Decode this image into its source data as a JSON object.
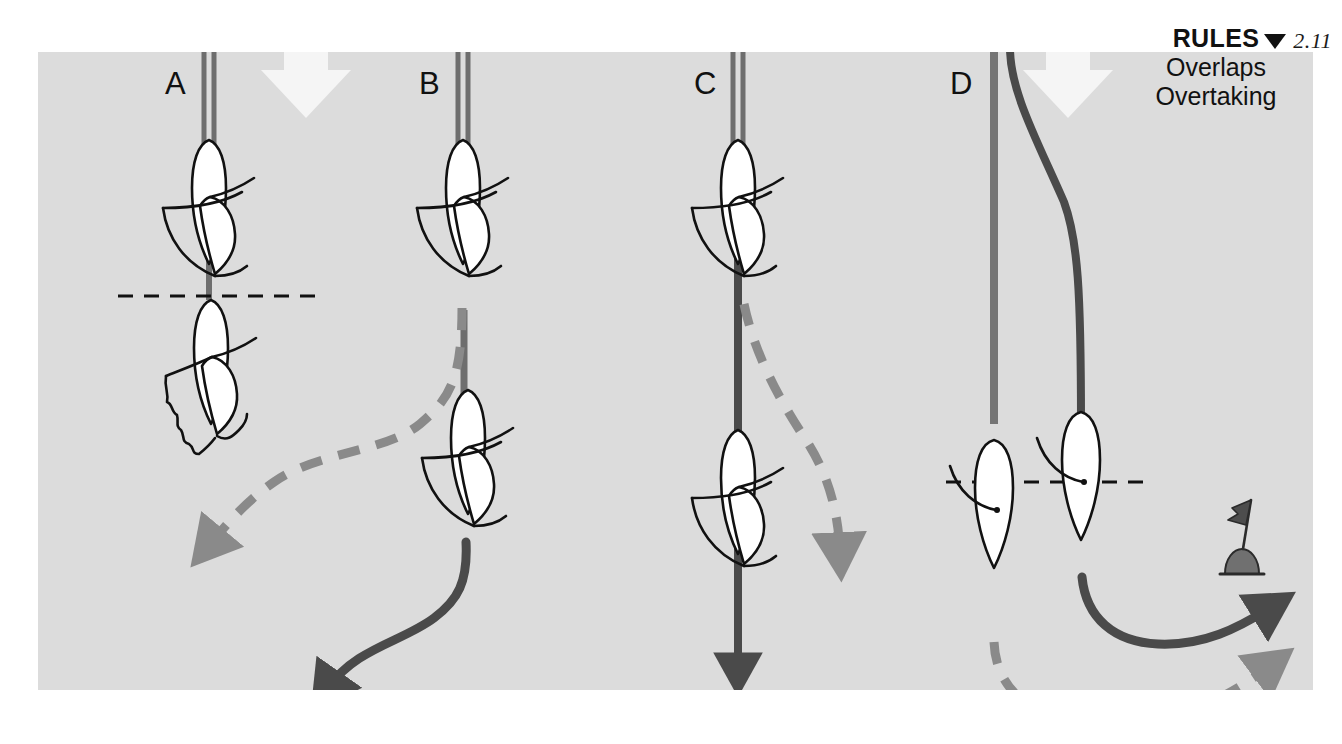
{
  "page": {
    "number": "2.11",
    "marker_icon": "down-triangle-icon",
    "background_color": "#ffffff",
    "plate_color": "#dcdcdc"
  },
  "heading": {
    "title": "RULES",
    "line2": "Overlaps",
    "line3": "Overtaking"
  },
  "colors": {
    "ink": "#1b1b1b",
    "track_solid_dark": "#4a4a4a",
    "track_solid_light": "#757575",
    "track_dashed": "#8a8a8a",
    "hull_fill": "#ffffff",
    "wind_arrow": "#f5f5f5",
    "plate": "#dcdcdc"
  },
  "panels": [
    {
      "id": "A",
      "label": "A",
      "caption_hidden": "Boats overlapped, windward boat keeps clear",
      "boats": 2,
      "has_overlap_line": true,
      "has_wind_arrow": true,
      "has_luffing_sail": true,
      "tracks": [
        "solid-light-straight"
      ]
    },
    {
      "id": "B",
      "label": "B",
      "caption_hidden": "Overtaking boat bears away astern",
      "boats": 2,
      "has_overlap_line": false,
      "has_wind_arrow": false,
      "tracks": [
        "solid-light-straight",
        "dashed-curve-left",
        "solid-dark-s-curve"
      ]
    },
    {
      "id": "C",
      "label": "C",
      "caption_hidden": "Overtaking boat passes to leeward",
      "boats": 2,
      "has_overlap_line": false,
      "has_wind_arrow": false,
      "tracks": [
        "solid-dark-straight",
        "dashed-curve-right"
      ]
    },
    {
      "id": "D",
      "label": "D",
      "caption_hidden": "Overlap at the mark, inside boat given room",
      "boats": 2,
      "has_overlap_line": true,
      "has_wind_arrow": true,
      "has_mark": true,
      "tracks": [
        "solid-light-straight",
        "solid-dark-curve",
        "dashed-curve-round-mark"
      ]
    }
  ],
  "mark": {
    "name": "racing-mark-buoy",
    "has_flag": true
  },
  "wind_arrows": [
    {
      "name": "wind-direction-arrow",
      "direction": "down"
    },
    {
      "name": "wind-direction-arrow",
      "direction": "down"
    }
  ]
}
